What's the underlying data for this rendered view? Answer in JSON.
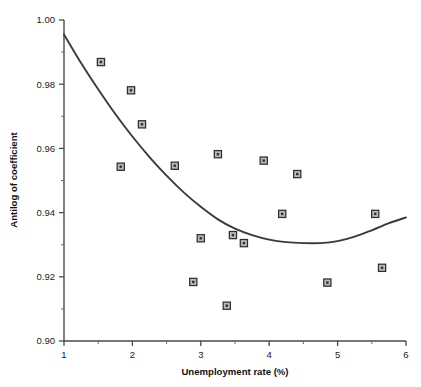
{
  "chart_data": {
    "type": "scatter",
    "title": "",
    "xlabel": "Unemployment rate (%)",
    "ylabel": "Antilog of coefficient",
    "xlim": [
      1,
      6
    ],
    "ylim": [
      0.9,
      1.0
    ],
    "grid": false,
    "legend": null,
    "x_ticks": [
      1,
      2,
      3,
      4,
      5,
      6
    ],
    "x_tick_labels": [
      "1",
      "2",
      "3",
      "4",
      "5",
      "6"
    ],
    "x_minor_ticks": [
      1.5,
      2.5,
      3.5,
      4.5,
      5.5
    ],
    "y_ticks": [
      0.9,
      0.92,
      0.94,
      0.96,
      0.98,
      1.0
    ],
    "y_tick_labels": [
      "0.90",
      "0.92",
      "0.94",
      "0.96",
      "0.98",
      "1.00"
    ],
    "y_minor_ticks": [
      0.91,
      0.93,
      0.95,
      0.97,
      0.99
    ],
    "marker": "square-with-center-dot",
    "marker_fill": "#b9b9b9",
    "marker_edge": "#2f2f2f",
    "curve_color": "#3a3a3a",
    "points": [
      {
        "x": 1.54,
        "y": 0.9869
      },
      {
        "x": 1.83,
        "y": 0.9543
      },
      {
        "x": 1.98,
        "y": 0.9781
      },
      {
        "x": 2.14,
        "y": 0.9675
      },
      {
        "x": 2.62,
        "y": 0.9546
      },
      {
        "x": 2.89,
        "y": 0.9184
      },
      {
        "x": 3.0,
        "y": 0.932
      },
      {
        "x": 3.25,
        "y": 0.9582
      },
      {
        "x": 3.38,
        "y": 0.911
      },
      {
        "x": 3.47,
        "y": 0.933
      },
      {
        "x": 3.63,
        "y": 0.9305
      },
      {
        "x": 3.92,
        "y": 0.9562
      },
      {
        "x": 4.19,
        "y": 0.9396
      },
      {
        "x": 4.41,
        "y": 0.952
      },
      {
        "x": 4.85,
        "y": 0.9182
      },
      {
        "x": 5.55,
        "y": 0.9396
      },
      {
        "x": 5.65,
        "y": 0.9228
      }
    ],
    "fit_curve": {
      "name": "quadratic fit",
      "vertex": {
        "x": 4.75,
        "y": 0.9305
      },
      "points": [
        {
          "x": 1.0,
          "y": 0.9955
        },
        {
          "x": 1.25,
          "y": 0.9866
        },
        {
          "x": 1.5,
          "y": 0.9784
        },
        {
          "x": 1.75,
          "y": 0.9707
        },
        {
          "x": 2.0,
          "y": 0.9637
        },
        {
          "x": 2.25,
          "y": 0.9573
        },
        {
          "x": 2.5,
          "y": 0.9515
        },
        {
          "x": 2.75,
          "y": 0.9463
        },
        {
          "x": 3.0,
          "y": 0.9418
        },
        {
          "x": 3.25,
          "y": 0.9379
        },
        {
          "x": 3.5,
          "y": 0.935
        },
        {
          "x": 3.75,
          "y": 0.933
        },
        {
          "x": 4.0,
          "y": 0.9316
        },
        {
          "x": 4.25,
          "y": 0.9308
        },
        {
          "x": 4.5,
          "y": 0.9305
        },
        {
          "x": 4.75,
          "y": 0.9305
        },
        {
          "x": 5.0,
          "y": 0.9311
        },
        {
          "x": 5.25,
          "y": 0.9325
        },
        {
          "x": 5.5,
          "y": 0.9345
        },
        {
          "x": 5.75,
          "y": 0.9367
        },
        {
          "x": 6.0,
          "y": 0.9385
        }
      ]
    }
  }
}
